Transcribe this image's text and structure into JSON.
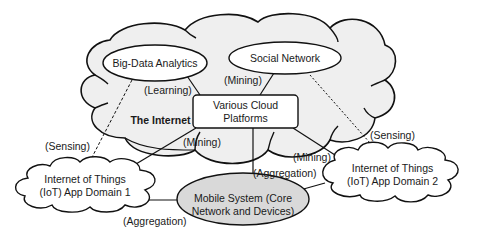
{
  "diagram": {
    "internet_cloud": {
      "label": "The Internet",
      "fill": "#efefef",
      "stroke": "#111111"
    },
    "nodes": {
      "big_data": {
        "label": "Big-Data Analytics"
      },
      "social": {
        "label": "Social Network"
      },
      "cloud_platforms": {
        "line1": "Various Cloud",
        "line2": "Platforms"
      },
      "iot1": {
        "line1": "Internet of Things",
        "line2": "(IoT) App Domain 1"
      },
      "iot2": {
        "line1": "Internet of Things",
        "line2": "(IoT) App Domain 2"
      },
      "mobile": {
        "line1": "Mobile System (Core",
        "line2": "Network and Devices)",
        "fill": "#d9d9d9"
      }
    },
    "edge_labels": {
      "learning": "(Learning)",
      "mining_social": "(Mining)",
      "mining_iot1": "(Mining)",
      "mining_iot2": "(Mining)",
      "sensing_left": "(Sensing)",
      "sensing_right": "(Sensing)",
      "aggregation_center": "(Aggregation)",
      "aggregation_left": "(Aggregation)"
    }
  }
}
